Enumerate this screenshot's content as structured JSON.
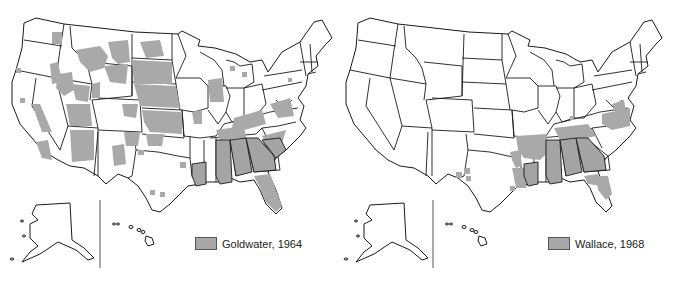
{
  "maps": [
    {
      "id": "goldwater",
      "legend": {
        "label": "Goldwater, 1964",
        "swatch_color": "#a8a8a8"
      },
      "description": "Counties carried by Goldwater in 1964 (shaded)",
      "solid_states": [
        "Mississippi",
        "Alabama",
        "Georgia",
        "South Carolina",
        "Louisiana"
      ]
    },
    {
      "id": "wallace",
      "legend": {
        "label": "Wallace, 1968",
        "swatch_color": "#a8a8a8"
      },
      "description": "Counties carried by Wallace in 1968 (shaded)",
      "solid_states": [
        "Louisiana",
        "Mississippi",
        "Alabama",
        "Georgia",
        "Arkansas"
      ]
    }
  ],
  "colors": {
    "shade": "#a9a9a9",
    "border": "#1a1a1a",
    "background": "#ffffff"
  }
}
